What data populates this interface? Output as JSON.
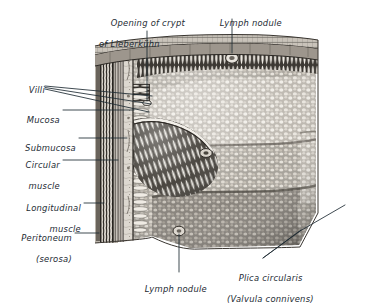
{
  "figure": {
    "title_visible": false,
    "style": "grayscale halftone engraving",
    "background_color": "#ffffff",
    "ink_color": "#1d2b33",
    "labels": [
      {
        "name": "opening-of-crypt-of-lieberkuhn",
        "line1": "Opening of crypt",
        "line2": "of Lieberkühn",
        "align": "left",
        "x": 99,
        "y": 7,
        "leader": [
          [
            147,
            31
          ],
          [
            147,
            101
          ]
        ]
      },
      {
        "name": "lymph-nodule-top",
        "line1": "Lymph nodule",
        "line2": "",
        "align": "left",
        "x": 208,
        "y": 7,
        "leader": [
          [
            232,
            19
          ],
          [
            232,
            55
          ]
        ]
      },
      {
        "name": "villi",
        "line1": "Villi",
        "line2": "",
        "align": "right",
        "x": 17,
        "y": 79,
        "leader": [
          [
            45,
            87
          ],
          [
            150,
            99
          ]
        ]
      },
      {
        "name": "mucosa",
        "line1": "Mucosa",
        "line2": "",
        "align": "right",
        "x": 17,
        "y": 105,
        "leader": [
          [
            62,
            110
          ],
          [
            133,
            110
          ]
        ]
      },
      {
        "name": "submucosa",
        "line1": "Submucosa",
        "line2": "",
        "align": "right",
        "x": 17,
        "y": 133,
        "leader": [
          [
            78,
            138
          ],
          [
            120,
            138
          ]
        ]
      },
      {
        "name": "circular-muscle",
        "line1": "Circular",
        "line2": "muscle",
        "align": "right",
        "x": 17,
        "y": 155,
        "leader": [
          [
            62,
            160
          ],
          [
            110,
            160
          ]
        ]
      },
      {
        "name": "longitudinal-muscle",
        "line1": "Longitudinal",
        "line2": "muscle",
        "align": "right",
        "x": 17,
        "y": 198,
        "leader": [
          [
            82,
            203
          ],
          [
            102,
            203
          ]
        ]
      },
      {
        "name": "peritoneum-serosa",
        "line1": "Peritoneum",
        "line2": "(serosa)",
        "align": "right",
        "x": 17,
        "y": 228,
        "leader": [
          [
            74,
            233
          ],
          [
            98,
            233
          ]
        ]
      },
      {
        "name": "lymph-nodule-bottom",
        "line1": "Lymph nodule",
        "line2": "",
        "align": "center",
        "x": 138,
        "y": 276,
        "leader": [
          [
            179,
            274
          ],
          [
            179,
            236
          ]
        ]
      },
      {
        "name": "plica-circularis",
        "line1": "Plica circularis",
        "line2": "(Valvula connivens)",
        "align": "left",
        "x": 227,
        "y": 262,
        "leader": [
          [
            266,
            259
          ],
          [
            345,
            207
          ]
        ]
      }
    ]
  }
}
